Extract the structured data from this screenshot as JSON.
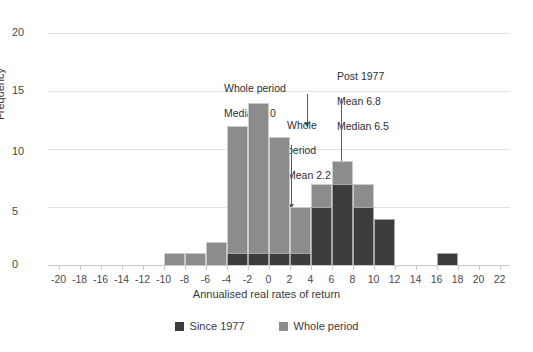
{
  "chart_data": {
    "type": "bar",
    "title": "",
    "subtitle": "",
    "xlabel": "Annualised real rates of return",
    "ylabel": "Frequency",
    "xlim": [
      -21,
      23
    ],
    "ylim": [
      0,
      20
    ],
    "grid": true,
    "bin_width": 2,
    "legend_position": "bottom-center",
    "x_ticks": [
      -20,
      -18,
      -16,
      -14,
      -12,
      -10,
      -8,
      -6,
      -4,
      -2,
      0,
      2,
      4,
      6,
      8,
      10,
      12,
      14,
      16,
      18,
      20,
      22
    ],
    "y_ticks": [
      0,
      5,
      10,
      15,
      20
    ],
    "bin_starts": [
      -10,
      -8,
      -6,
      -4,
      -2,
      0,
      2,
      4,
      6,
      8,
      10,
      16
    ],
    "series": [
      {
        "name": "Whole period",
        "color": "#8c8c8c",
        "values": [
          1,
          1,
          2,
          12,
          14,
          11,
          5,
          7,
          9,
          7,
          4,
          0
        ]
      },
      {
        "name": "Since 1977",
        "color": "#3c3c3c",
        "values": [
          0,
          0,
          0,
          1,
          1,
          1,
          1,
          5,
          7,
          5,
          4,
          1
        ]
      }
    ],
    "annotations": [
      {
        "id": "whole-period-median",
        "text": "Whole period\nMedian 1.0",
        "value": 1.0,
        "stat": "Median",
        "series": "Whole period"
      },
      {
        "id": "whole-period-mean",
        "text": "Whole\nperiod\nMean 2.2",
        "value": 2.2,
        "stat": "Mean",
        "series": "Whole period"
      },
      {
        "id": "post-1977-stats",
        "text": "Post 1977\nMean 6.8\nMedian 6.5",
        "mean": 6.8,
        "median": 6.5,
        "series": "Since 1977"
      }
    ]
  },
  "axes": {
    "y_title": "Frequency",
    "x_title": "Annualised real rates of return",
    "y_tick_labels": [
      "0",
      "5",
      "10",
      "15",
      "20"
    ],
    "x_tick_labels": [
      "-20",
      "-18",
      "-16",
      "-14",
      "-12",
      "-10",
      "-8",
      "-6",
      "-4",
      "-2",
      "0",
      "2",
      "4",
      "6",
      "8",
      "10",
      "12",
      "14",
      "16",
      "18",
      "20",
      "22"
    ]
  },
  "legend": {
    "items": [
      {
        "label": "Since 1977",
        "color": "#3c3c3c"
      },
      {
        "label": "Whole period",
        "color": "#8c8c8c"
      }
    ]
  },
  "annotations": {
    "a1_line1": "Whole period",
    "a1_line2": "Median 1.0",
    "a2_line1": "Whole",
    "a2_line2": "period",
    "a2_line3": "Mean 2.2",
    "a3_line1": "Post 1977",
    "a3_line2": "Mean 6.8",
    "a3_line3": "Median 6.5"
  },
  "colors": {
    "since_1977": "#3c3c3c",
    "whole_period": "#8c8c8c",
    "gridline": "#e2e2e2",
    "text": "#2f2f2f"
  }
}
